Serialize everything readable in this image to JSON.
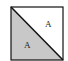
{
  "diagram": {
    "shape": "square divided by diagonal",
    "colors": {
      "shaded": "#c8c8c8",
      "unshaded": "#ffffff",
      "stroke": "#111111"
    },
    "regions": [
      {
        "name": "upper-right-triangle",
        "label": "A",
        "shaded": false
      },
      {
        "name": "lower-left-triangle",
        "label": "A",
        "shaded": true
      }
    ]
  }
}
